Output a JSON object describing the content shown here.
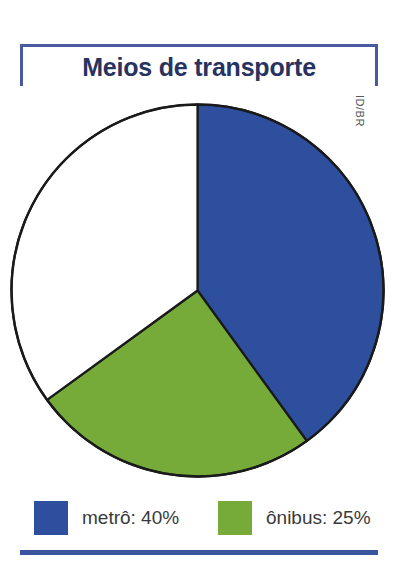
{
  "figure": {
    "title": "Meios de transporte",
    "credit": "ID/BR",
    "frame_color": "#4a5a9e",
    "title_color": "#28335f",
    "rule_color": "#3a55a0",
    "background": "#ffffff"
  },
  "legend": {
    "position": "bottom",
    "items": [
      {
        "label": "metrô: 40%",
        "color": "#2d4f9e"
      },
      {
        "label": "ônibus: 25%",
        "color": "#76ab3a"
      }
    ]
  },
  "chart_data": {
    "type": "pie",
    "title": "Meios de transporte",
    "xlabel": "",
    "ylabel": "",
    "units": "percent",
    "start_angle_deg": 0,
    "direction": "clockwise",
    "stroke_color": "#1a1a1a",
    "categories": [
      "metrô",
      "ônibus",
      "outros"
    ],
    "values": [
      40,
      25,
      35
    ],
    "slices": [
      {
        "name": "metrô",
        "value": 40,
        "label": "metrô: 40%",
        "color": "#2d4f9e",
        "start_deg": 0,
        "end_deg": 144,
        "in_legend": true
      },
      {
        "name": "ônibus",
        "value": 25,
        "label": "ônibus: 25%",
        "color": "#76ab3a",
        "start_deg": 144,
        "end_deg": 234,
        "in_legend": true
      },
      {
        "name": "outros",
        "value": 35,
        "label": "",
        "color": "#ffffff",
        "start_deg": 234,
        "end_deg": 360,
        "in_legend": false
      }
    ],
    "legend": [
      "metrô: 40%",
      "ônibus: 25%"
    ],
    "grid": false
  }
}
